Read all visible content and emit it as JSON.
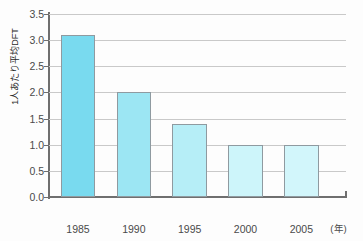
{
  "chart_data": {
    "type": "bar",
    "title": "",
    "xlabel": "(年)",
    "ylabel": "1人あたり平均DFT",
    "categories": [
      "1985",
      "1990",
      "1995",
      "2000",
      "2005"
    ],
    "values": [
      3.1,
      2.0,
      1.4,
      1.0,
      1.0
    ],
    "ylim": [
      0.0,
      3.5
    ],
    "ytick_labels": [
      "0.0",
      "0.5",
      "1.0",
      "1.5",
      "2.0",
      "2.5",
      "3.0",
      "3.5"
    ],
    "ytick_values": [
      0.0,
      0.5,
      1.0,
      1.5,
      2.0,
      2.5,
      3.0,
      3.5
    ],
    "grid": "horizontal",
    "legend": "none",
    "bar_colors": [
      "#79daef",
      "#9ce6f3",
      "#b6eef7",
      "#cdf5fa",
      "#d2f6fb"
    ],
    "bar_border_color": "#8f9aa0",
    "axis_color": "#6f6f6f",
    "grid_color": "#c9c9c9",
    "background": "#fdfdfd"
  }
}
